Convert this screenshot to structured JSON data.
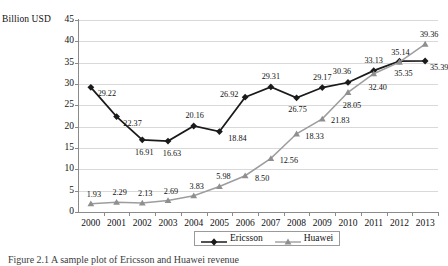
{
  "chart_data": {
    "type": "line",
    "title": "",
    "xlabel": "",
    "ylabel": "Billion USD",
    "ylim": [
      0,
      45
    ],
    "ytick_step": 5,
    "yticks": [
      "0",
      "5",
      "10",
      "15",
      "20",
      "25",
      "30",
      "35",
      "40",
      "45"
    ],
    "grid": true,
    "legend_position": "bottom-center",
    "categories": [
      "2000",
      "2001",
      "2002",
      "2003",
      "2004",
      "2005",
      "2006",
      "2007",
      "2008",
      "2009",
      "2010",
      "2011",
      "2012",
      "2013"
    ],
    "series": [
      {
        "name": "Ericsson",
        "color": "#1a1a1a",
        "marker": "diamond",
        "values": [
          29.22,
          22.37,
          16.91,
          16.63,
          20.16,
          18.84,
          26.92,
          29.31,
          26.75,
          29.17,
          30.36,
          33.13,
          35.35,
          35.39
        ],
        "labels": [
          "29.22",
          "22.37",
          "16.91",
          "16.63",
          "20.16",
          "18.84",
          "26.92",
          "29.31",
          "26.75",
          "29.17",
          "30.36",
          "33.13",
          "35.35",
          "35.39"
        ]
      },
      {
        "name": "Huawei",
        "color": "#9d9d9d",
        "marker": "triangle",
        "values": [
          1.93,
          2.29,
          2.13,
          2.69,
          3.83,
          5.98,
          8.5,
          12.56,
          18.33,
          21.83,
          28.05,
          32.4,
          35.14,
          39.36
        ],
        "labels": [
          "1.93",
          "2.29",
          "2.13",
          "2.69",
          "3.83",
          "5.98",
          "8.50",
          "12.56",
          "18.33",
          "21.83",
          "28.05",
          "32.40",
          "35.14",
          "39.36"
        ]
      }
    ]
  },
  "axis": {
    "y_title": "Billion USD"
  },
  "legend": {
    "items": [
      {
        "label": "Ericsson"
      },
      {
        "label": "Huawei"
      }
    ]
  },
  "caption": {
    "text": "Figure 2.1  A sample plot of Ericsson and Huawei revenue"
  }
}
